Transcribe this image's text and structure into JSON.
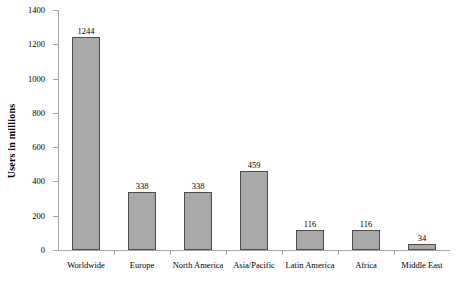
{
  "chart_data": {
    "type": "bar",
    "title": "",
    "subtitle": "",
    "xlabel": "",
    "ylabel": "Users in millions",
    "categories": [
      "Worldwide",
      "Europe",
      "North America",
      "Asia/Pacific",
      "Latin America",
      "Africa",
      "Middle East"
    ],
    "values": [
      1244,
      338,
      338,
      459,
      116,
      116,
      34
    ],
    "value_labels": [
      "1244",
      "338",
      "338",
      "459",
      "116",
      "116",
      "34"
    ],
    "ylim": [
      0,
      1400
    ],
    "ytick_values": [
      0,
      200,
      400,
      600,
      800,
      1000,
      1200,
      1400
    ],
    "ytick_labels": [
      "0",
      "200",
      "400",
      "600",
      "800",
      "1000",
      "1200",
      "1400"
    ],
    "grid": false,
    "legend": false,
    "legend_position": "none",
    "bar_fill_color": "#a9a9a9",
    "bar_border_color": "#4d4d4d",
    "axis_color": "#a6a6a6",
    "background_color": "#ffffff",
    "text_color": "#000000"
  }
}
